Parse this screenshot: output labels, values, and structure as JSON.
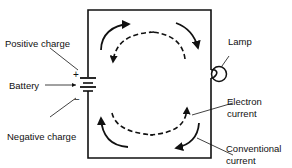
{
  "diagram": {
    "type": "circuit",
    "labels": {
      "positive_charge": "Positive charge",
      "battery": "Battery",
      "negative_charge": "Negative charge",
      "lamp": "Lamp",
      "electron_current_line1": "Electron",
      "electron_current_line2": "current",
      "conventional_current_line1": "Conventional",
      "conventional_current_line2": "current"
    },
    "symbols": {
      "plus": "+",
      "minus": "−"
    },
    "legend": {
      "solid_arrows": "Conventional current (clockwise)",
      "dashed_arrows": "Electron current (counter-clockwise)"
    },
    "colors": {
      "line": "#111111",
      "background": "#ffffff"
    }
  }
}
